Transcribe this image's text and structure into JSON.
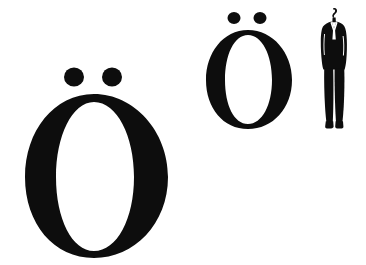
{
  "canvas": {
    "width": 366,
    "height": 265,
    "background_color": "#ffffff",
    "ink_color": "#0d0d0d"
  },
  "scene": {
    "description": "Typographic scale comparison: two sizes of the letter O with diaeresis shown beside a human silhouette for scale",
    "items": [
      {
        "id": "glyph-large",
        "kind": "glyph",
        "character": "Ö",
        "base_letter": "O",
        "diacritic": "diaeresis",
        "case": "uppercase",
        "fill_color": "#0d0d0d",
        "size_label": "large",
        "bounds": {
          "x": 22,
          "y": 64,
          "width": 150,
          "height": 195
        }
      },
      {
        "id": "glyph-medium",
        "kind": "glyph",
        "character": "Ö",
        "base_letter": "O",
        "diacritic": "diaeresis",
        "case": "uppercase",
        "fill_color": "#0d0d0d",
        "size_label": "medium",
        "bounds": {
          "x": 204,
          "y": 8,
          "width": 90,
          "height": 124
        }
      },
      {
        "id": "figure-human",
        "kind": "silhouette",
        "subject": "standing man in a business suit",
        "fill_color": "#0d0d0d",
        "size_label": "reference",
        "bounds": {
          "x": 314,
          "y": 6,
          "width": 40,
          "height": 124
        }
      }
    ]
  }
}
